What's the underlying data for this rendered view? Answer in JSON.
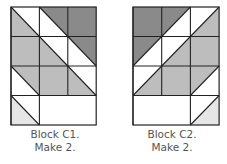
{
  "colors": {
    "dark": "#8a8a8a",
    "medium": "#bdbdbd",
    "light": "#e6e6e6",
    "white": "#ffffff",
    "line": "#222222"
  },
  "blocks": [
    {
      "id": "C1",
      "caption_line1": "Block C1.",
      "caption_line2": "Make 2.",
      "grid": {
        "cols": 3,
        "rows": 4
      },
      "cells": [
        [
          {
            "type": "half",
            "diag": "backslash",
            "lower": "medium",
            "upper": "white"
          },
          {
            "type": "half",
            "diag": "backslash",
            "lower": "white",
            "upper": "dark"
          },
          {
            "type": "full",
            "fill": "dark"
          }
        ],
        [
          {
            "type": "full",
            "fill": "medium"
          },
          {
            "type": "half",
            "diag": "backslash",
            "lower": "medium",
            "upper": "white"
          },
          {
            "type": "half",
            "diag": "backslash",
            "lower": "white",
            "upper": "dark"
          }
        ],
        [
          {
            "type": "half",
            "diag": "backslash",
            "lower": "white",
            "upper": "medium"
          },
          {
            "type": "full",
            "fill": "medium"
          },
          {
            "type": "half",
            "diag": "backslash",
            "lower": "medium",
            "upper": "white"
          }
        ],
        [
          {
            "type": "half",
            "diag": "backslash",
            "lower": "light",
            "upper": "white"
          },
          {
            "type": "merged",
            "fill": "white",
            "span": 2
          }
        ]
      ]
    },
    {
      "id": "C2",
      "caption_line1": "Block C2.",
      "caption_line2": "Make 2.",
      "grid": {
        "cols": 3,
        "rows": 4
      },
      "cells": [
        [
          {
            "type": "full",
            "fill": "dark"
          },
          {
            "type": "half",
            "diag": "slash",
            "upper": "dark",
            "lower": "white"
          },
          {
            "type": "half",
            "diag": "slash",
            "upper": "white",
            "lower": "medium"
          }
        ],
        [
          {
            "type": "half",
            "diag": "slash",
            "upper": "dark",
            "lower": "white"
          },
          {
            "type": "half",
            "diag": "slash",
            "upper": "white",
            "lower": "medium"
          },
          {
            "type": "full",
            "fill": "medium"
          }
        ],
        [
          {
            "type": "half",
            "diag": "slash",
            "upper": "white",
            "lower": "medium"
          },
          {
            "type": "full",
            "fill": "medium"
          },
          {
            "type": "half",
            "diag": "slash",
            "upper": "medium",
            "lower": "white"
          }
        ],
        [
          {
            "type": "merged",
            "fill": "white",
            "span": 2
          },
          {
            "type": "half",
            "diag": "slash",
            "upper": "white",
            "lower": "light"
          }
        ]
      ]
    }
  ]
}
